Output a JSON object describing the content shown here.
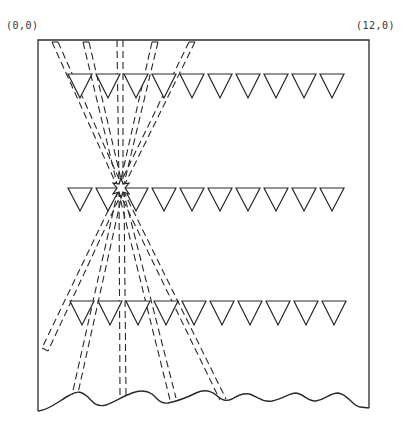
{
  "diagram": {
    "labels": {
      "origin": "(0,0)",
      "end": "(12,0)"
    },
    "rows": [
      {
        "name": "top-row",
        "y": 74,
        "count": 10
      },
      {
        "name": "middle-row",
        "y": 188,
        "count": 10
      },
      {
        "name": "bottom-row",
        "y": 300,
        "count": 10
      }
    ],
    "triangle": {
      "width": 24,
      "height": 24,
      "start_x": 68,
      "spacing": 28
    },
    "focal_point": {
      "x": 121,
      "y": 188
    },
    "colors": {
      "stroke": "#2a2a2a",
      "background": "#ffffff"
    }
  }
}
